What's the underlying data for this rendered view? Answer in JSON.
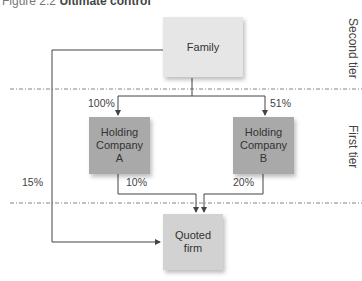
{
  "caption": {
    "prefix": "Figure 2.2",
    "title": "Ultimate control"
  },
  "tiers": {
    "second": "Second tier",
    "first": "First tier"
  },
  "nodes": {
    "family": "Family",
    "holding_a": [
      "Holding",
      "Company",
      "A"
    ],
    "holding_b": [
      "Holding",
      "Company",
      "B"
    ],
    "quoted": [
      "Quoted",
      "firm"
    ]
  },
  "edges": {
    "family_to_a": "100%",
    "family_to_b": "51%",
    "a_to_quoted": "10%",
    "b_to_quoted": "20%",
    "family_to_quoted": "15%"
  },
  "colors": {
    "family": "#e6e6e6",
    "holding": "#a9a9a9",
    "quoted": "#d2d2d2",
    "line": "#444444"
  }
}
